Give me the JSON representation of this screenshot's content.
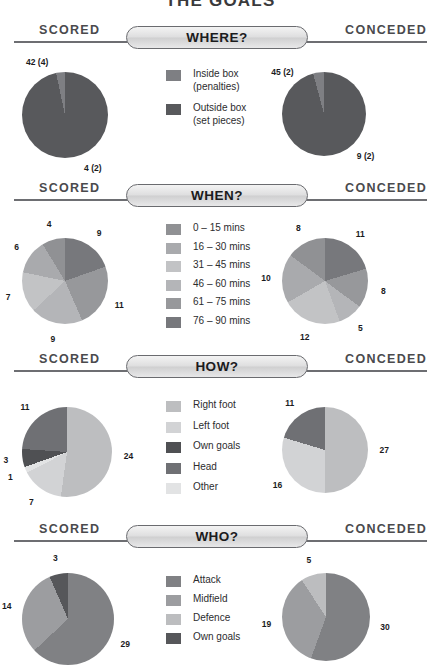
{
  "title": "THE GOALS",
  "band": {
    "scored": "SCORED",
    "conceded": "CONCEDED"
  },
  "sections": [
    {
      "key": "where",
      "heading": "WHERE?",
      "legend": [
        {
          "label": "Inside box\n(penalties)",
          "color": "#7e7f83"
        },
        {
          "label": "Outside box\n(set pieces)",
          "color": "#58595c"
        }
      ],
      "scored": {
        "labels": [
          "4 (2)",
          "42 (4)"
        ],
        "slices": [
          {
            "name": "Inside box (penalties)",
            "value": 42,
            "sub": 4,
            "color": "#7e7f83"
          },
          {
            "name": "Outside box (set pieces)",
            "value": 4,
            "sub": 2,
            "color": "#58595c"
          }
        ]
      },
      "conceded": {
        "labels": [
          "9 (2)",
          "45 (2)"
        ],
        "slices": [
          {
            "name": "Inside box (penalties)",
            "value": 45,
            "sub": 2,
            "color": "#7e7f83"
          },
          {
            "name": "Outside box (set pieces)",
            "value": 9,
            "sub": 2,
            "color": "#58595c"
          }
        ]
      }
    },
    {
      "key": "when",
      "heading": "WHEN?",
      "legend": [
        {
          "label": "0 – 15 mins",
          "color": "#909194"
        },
        {
          "label": "16 – 30 mins",
          "color": "#a9aaad"
        },
        {
          "label": "31 – 45 mins",
          "color": "#c2c3c5"
        },
        {
          "label": "46 – 60 mins",
          "color": "#b4b5b8"
        },
        {
          "label": "61 – 75 mins",
          "color": "#97989b"
        },
        {
          "label": "76 – 90 mins",
          "color": "#77787c"
        }
      ],
      "scored": {
        "labels": [
          "9",
          "11",
          "9",
          "7",
          "6",
          "4"
        ],
        "slices": [
          {
            "name": "76 – 90 mins",
            "value": 9,
            "color": "#77787c"
          },
          {
            "name": "61 – 75 mins",
            "value": 11,
            "color": "#97989b"
          },
          {
            "name": "46 – 60 mins",
            "value": 9,
            "color": "#b4b5b8"
          },
          {
            "name": "31 – 45 mins",
            "value": 7,
            "color": "#c2c3c5"
          },
          {
            "name": "16 – 30 mins",
            "value": 6,
            "color": "#a9aaad"
          },
          {
            "name": "0 – 15 mins",
            "value": 4,
            "color": "#909194"
          }
        ]
      },
      "conceded": {
        "labels": [
          "11",
          "8",
          "5",
          "12",
          "10",
          "8"
        ],
        "slices": [
          {
            "name": "76 – 90 mins",
            "value": 11,
            "color": "#77787c"
          },
          {
            "name": "61 – 75 mins",
            "value": 8,
            "color": "#97989b"
          },
          {
            "name": "46 – 60 mins",
            "value": 5,
            "color": "#b4b5b8"
          },
          {
            "name": "31 – 45 mins",
            "value": 12,
            "color": "#c2c3c5"
          },
          {
            "name": "16 – 30 mins",
            "value": 10,
            "color": "#a9aaad"
          },
          {
            "name": "0 – 15 mins",
            "value": 8,
            "color": "#909194"
          }
        ]
      }
    },
    {
      "key": "how",
      "heading": "HOW?",
      "legend": [
        {
          "label": "Right foot",
          "color": "#bdbec0"
        },
        {
          "label": "Left foot",
          "color": "#d2d3d5"
        },
        {
          "label": "Own goals",
          "color": "#4f5053"
        },
        {
          "label": "Head",
          "color": "#6f7074"
        },
        {
          "label": "Other",
          "color": "#e2e3e4"
        }
      ],
      "scored": {
        "labels": [
          "24",
          "7",
          "1",
          "3",
          "11"
        ],
        "slices": [
          {
            "name": "Right foot",
            "value": 24,
            "color": "#bdbec0"
          },
          {
            "name": "Left foot",
            "value": 7,
            "color": "#d2d3d5"
          },
          {
            "name": "Other",
            "value": 1,
            "color": "#e2e3e4"
          },
          {
            "name": "Own goals",
            "value": 3,
            "color": "#4f5053"
          },
          {
            "name": "Head",
            "value": 11,
            "color": "#6f7074"
          }
        ]
      },
      "conceded": {
        "labels": [
          "27",
          "16",
          "11"
        ],
        "slices": [
          {
            "name": "Right foot",
            "value": 27,
            "color": "#bdbec0"
          },
          {
            "name": "Left foot",
            "value": 16,
            "color": "#d2d3d5"
          },
          {
            "name": "Head",
            "value": 11,
            "color": "#6f7074"
          }
        ]
      }
    },
    {
      "key": "who",
      "heading": "WHO?",
      "legend": [
        {
          "label": "Attack",
          "color": "#808184"
        },
        {
          "label": "Midfield",
          "color": "#9c9da0"
        },
        {
          "label": "Defence",
          "color": "#bcbdbf"
        },
        {
          "label": "Own goals",
          "color": "#56575a"
        }
      ],
      "scored": {
        "labels": [
          "29",
          "14",
          "3"
        ],
        "slices": [
          {
            "name": "Attack",
            "value": 29,
            "color": "#808184"
          },
          {
            "name": "Midfield",
            "value": 14,
            "color": "#9c9da0"
          },
          {
            "name": "Own goals",
            "value": 3,
            "color": "#56575a"
          }
        ]
      },
      "conceded": {
        "labels": [
          "30",
          "19",
          "5"
        ],
        "slices": [
          {
            "name": "Attack",
            "value": 30,
            "color": "#808184"
          },
          {
            "name": "Midfield",
            "value": 19,
            "color": "#9c9da0"
          },
          {
            "name": "Defence",
            "value": 5,
            "color": "#bcbdbf"
          }
        ]
      }
    }
  ],
  "chart_data": [
    {
      "type": "pie",
      "title": "WHERE? – Scored",
      "categories": [
        "Inside box (penalties)",
        "Outside box (set pieces)"
      ],
      "values": [
        42,
        4
      ],
      "labels": [
        "42 (4)",
        "4 (2)"
      ]
    },
    {
      "type": "pie",
      "title": "WHERE? – Conceded",
      "categories": [
        "Inside box (penalties)",
        "Outside box (set pieces)"
      ],
      "values": [
        45,
        9
      ],
      "labels": [
        "45 (2)",
        "9 (2)"
      ]
    },
    {
      "type": "pie",
      "title": "WHEN? – Scored",
      "categories": [
        "0 – 15 mins",
        "16 – 30 mins",
        "31 – 45 mins",
        "46 – 60 mins",
        "61 – 75 mins",
        "76 – 90 mins"
      ],
      "values": [
        4,
        6,
        7,
        9,
        11,
        9
      ]
    },
    {
      "type": "pie",
      "title": "WHEN? – Conceded",
      "categories": [
        "0 – 15 mins",
        "16 – 30 mins",
        "31 – 45 mins",
        "46 – 60 mins",
        "61 – 75 mins",
        "76 – 90 mins"
      ],
      "values": [
        8,
        10,
        12,
        5,
        8,
        11
      ]
    },
    {
      "type": "pie",
      "title": "HOW? – Scored",
      "categories": [
        "Right foot",
        "Left foot",
        "Own goals",
        "Head",
        "Other"
      ],
      "values": [
        24,
        7,
        3,
        11,
        1
      ]
    },
    {
      "type": "pie",
      "title": "HOW? – Conceded",
      "categories": [
        "Right foot",
        "Left foot",
        "Own goals",
        "Head",
        "Other"
      ],
      "values": [
        27,
        16,
        0,
        11,
        0
      ]
    },
    {
      "type": "pie",
      "title": "WHO? – Scored",
      "categories": [
        "Attack",
        "Midfield",
        "Defence",
        "Own goals"
      ],
      "values": [
        29,
        14,
        0,
        3
      ]
    },
    {
      "type": "pie",
      "title": "WHO? – Conceded",
      "categories": [
        "Attack",
        "Midfield",
        "Defence",
        "Own goals"
      ],
      "values": [
        30,
        19,
        5,
        0
      ]
    }
  ]
}
